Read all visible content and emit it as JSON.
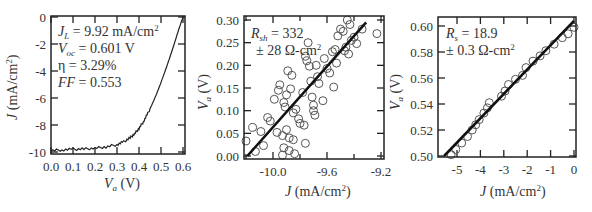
{
  "chart_data": [
    {
      "type": "line",
      "panel": 1,
      "title": "",
      "xlabel": "V_a (V)",
      "ylabel": "J (mA/cm^2)",
      "xlim": [
        0.0,
        0.6
      ],
      "ylim": [
        -10,
        0
      ],
      "xticks": [
        "0.0",
        "0.1",
        "0.2",
        "0.3",
        "0.4",
        "0.5",
        "0.6"
      ],
      "yticks": [
        "0",
        "-2",
        "-4",
        "-6",
        "-8",
        "-10"
      ],
      "annotations": [
        "J_L = 9.92 mA/cm²",
        "V_oc = 0.601 V",
        "η = 3.29%",
        "FF = 0.553"
      ],
      "series": [
        {
          "name": "J-V curve",
          "x": [
            0.0,
            0.05,
            0.1,
            0.15,
            0.2,
            0.25,
            0.3,
            0.33,
            0.36,
            0.38,
            0.4,
            0.42,
            0.44,
            0.46,
            0.48,
            0.5,
            0.52,
            0.54,
            0.56,
            0.58,
            0.6
          ],
          "y": [
            -9.88,
            -9.85,
            -9.8,
            -9.78,
            -9.72,
            -9.62,
            -9.45,
            -9.25,
            -8.95,
            -8.65,
            -8.25,
            -7.75,
            -7.15,
            -6.45,
            -5.7,
            -4.85,
            -3.95,
            -3.0,
            -2.0,
            -0.95,
            0.0
          ]
        }
      ]
    },
    {
      "type": "scatter",
      "panel": 2,
      "xlabel": "J (mA/cm^2)",
      "ylabel": "V_a (V)",
      "xlim": [
        -10.21,
        -9.18
      ],
      "ylim": [
        0.0,
        0.3
      ],
      "xticks": [
        "-10.0",
        "-9.6",
        "-9.2"
      ],
      "yticks": [
        "0.30",
        "0.25",
        "0.20",
        "0.15",
        "0.10",
        "0.05",
        "0.00"
      ],
      "annotations": [
        "R_sh = 332",
        "± 28 Ω-cm²"
      ],
      "fit": {
        "x": [
          -10.19,
          -9.31
        ],
        "y": [
          0.0,
          0.295
        ]
      },
      "series": [
        {
          "name": "data",
          "x": [
            -10.2,
            -10.15,
            -10.13,
            -10.09,
            -10.07,
            -10.04,
            -10.02,
            -9.99,
            -9.97,
            -9.96,
            -9.95,
            -9.93,
            -9.93,
            -9.92,
            -9.92,
            -9.91,
            -9.9,
            -9.9,
            -9.89,
            -9.88,
            -9.88,
            -9.87,
            -9.86,
            -9.85,
            -9.85,
            -9.84,
            -9.83,
            -9.81,
            -9.8,
            -9.78,
            -9.77,
            -9.76,
            -9.76,
            -9.75,
            -9.74,
            -9.73,
            -9.72,
            -9.71,
            -9.7,
            -9.7,
            -9.69,
            -9.68,
            -9.67,
            -9.66,
            -9.63,
            -9.62,
            -9.6,
            -9.58,
            -9.56,
            -9.55,
            -9.54,
            -9.53,
            -9.52,
            -9.5,
            -9.48,
            -9.47,
            -9.46,
            -9.45,
            -9.44,
            -9.43,
            -9.42,
            -9.4,
            -9.38,
            -9.34,
            -9.23
          ],
          "y": [
            0.033,
            0.063,
            0.01,
            0.054,
            0.023,
            0.085,
            0.077,
            0.125,
            0.052,
            0.145,
            0.157,
            0.002,
            0.045,
            0.118,
            0.018,
            0.108,
            0.058,
            0.135,
            0.188,
            0.04,
            0.012,
            0.148,
            0.178,
            0.036,
            0.095,
            0.005,
            0.103,
            0.082,
            0.072,
            0.14,
            0.068,
            0.028,
            0.22,
            0.21,
            0.25,
            0.198,
            0.165,
            0.13,
            0.112,
            0.1,
            0.09,
            0.2,
            0.175,
            0.16,
            0.122,
            0.215,
            0.193,
            0.183,
            0.23,
            0.152,
            0.235,
            0.205,
            0.265,
            0.28,
            0.275,
            0.232,
            0.24,
            0.3,
            0.225,
            0.29,
            0.255,
            0.262,
            0.248,
            0.28,
            0.27,
            0.258
          ]
        }
      ]
    },
    {
      "type": "scatter",
      "panel": 3,
      "xlabel": "J (mA/cm^2)",
      "ylabel": "V_a (V)",
      "xlim": [
        -5.8,
        0.1
      ],
      "ylim": [
        0.5,
        0.605
      ],
      "xticks": [
        "-5",
        "-4",
        "-3",
        "-2",
        "-1",
        "0"
      ],
      "yticks": [
        "0.60",
        "0.58",
        "0.56",
        "0.54",
        "0.52",
        "0.50"
      ],
      "annotations": [
        "R_s = 18.9",
        "± 0.3 Ω-cm²"
      ],
      "fit": {
        "x": [
          -5.55,
          0.0
        ],
        "y": [
          0.5,
          0.604
        ]
      },
      "series": [
        {
          "name": "data",
          "x": [
            -5.25,
            -5.05,
            -4.8,
            -4.55,
            -4.35,
            -4.2,
            -4.05,
            -3.85,
            -3.7,
            -3.62,
            -3.1,
            -2.95,
            -2.8,
            -2.5,
            -2.2,
            -2.05,
            -1.75,
            -1.45,
            -1.2,
            -0.85,
            -0.5,
            -0.25,
            0.0
          ],
          "y": [
            0.501,
            0.505,
            0.51,
            0.515,
            0.52,
            0.524,
            0.528,
            0.533,
            0.537,
            0.541,
            0.546,
            0.55,
            0.555,
            0.559,
            0.562,
            0.568,
            0.573,
            0.577,
            0.581,
            0.586,
            0.591,
            0.594,
            0.599
          ]
        }
      ]
    }
  ],
  "labels": {
    "p1": {
      "xlabel_main": "V",
      "xlabel_sub": "a",
      "xlabel_unit": " (V)",
      "ylabel_main": "J",
      "ylabel_unit": " (mA/cm",
      "ylabel_sup": "2",
      "ylabel_close": ")",
      "a1_main": "J",
      "a1_sub": "L",
      "a1_rest": " = 9.92 mA/cm",
      "a1_sup": "2",
      "a2_main": "V",
      "a2_sub": "oc",
      "a2_rest": " = 0.601 V",
      "a3": "η = 3.29%",
      "a4_main": "FF",
      "a4_rest": " = 0.553"
    },
    "p2": {
      "xlabel_main": "J",
      "xlabel_unit": " (mA/cm",
      "xlabel_sup": "2",
      "xlabel_close": ")",
      "ylabel_main": "V",
      "ylabel_sub": "a",
      "ylabel_unit": " (V)",
      "a1_main": "R",
      "a1_sub": "sh",
      "a1_rest": " = 332",
      "a2": "± 28 Ω-cm",
      "a2_sup": "2"
    },
    "p3": {
      "xlabel_main": "J",
      "xlabel_unit": " (mA/cm",
      "xlabel_sup": "2",
      "xlabel_close": ")",
      "ylabel_main": "V",
      "ylabel_sub": "a",
      "ylabel_unit": " (V)",
      "a1_main": "R",
      "a1_sub": "s",
      "a1_rest": " = 18.9",
      "a2": "± 0.3 Ω-cm",
      "a2_sup": "2"
    }
  }
}
